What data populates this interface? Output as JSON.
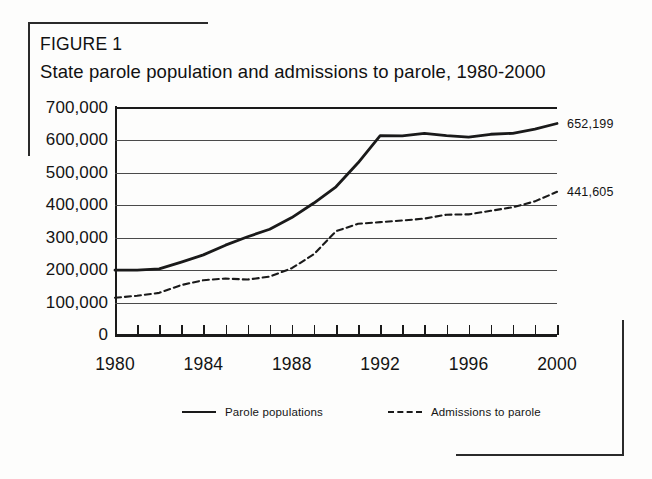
{
  "figure": {
    "label": "FIGURE 1",
    "title": "State parole population and admissions to parole, 1980-2000"
  },
  "legend": {
    "items": [
      {
        "label": "Parole populations",
        "style": "solid",
        "key_icon": "solid-line-icon"
      },
      {
        "label": "Admissions to parole",
        "style": "dashed",
        "key_icon": "dashed-line-icon"
      }
    ]
  },
  "axes": {
    "y_tick_labels": [
      "700,000",
      "600,000",
      "500,000",
      "400,000",
      "300,000",
      "200,000",
      "100,000",
      "0"
    ],
    "x_tick_labels": [
      "1980",
      "1984",
      "1988",
      "1992",
      "1996",
      "2000"
    ]
  },
  "end_labels": {
    "parole_populations": "652,199",
    "admissions_to_parole": "441,605"
  },
  "colors": {
    "ink": "#1a1a1a",
    "grid": "#4a4a4a",
    "paper": "#fdfdfc"
  },
  "chart_data": {
    "type": "line",
    "title": "State parole population and admissions to parole, 1980-2000",
    "xlabel": "",
    "ylabel": "",
    "xlim": [
      1980,
      2000
    ],
    "ylim": [
      0,
      700000
    ],
    "ytick_values": [
      0,
      100000,
      200000,
      300000,
      400000,
      500000,
      600000,
      700000
    ],
    "xtick_values": [
      1980,
      1984,
      1988,
      1992,
      1996,
      2000
    ],
    "xtick_labeled": [
      1980,
      1984,
      1988,
      1992,
      1996,
      2000
    ],
    "grid": true,
    "legend_position": "bottom",
    "x": [
      1980,
      1981,
      1982,
      1983,
      1984,
      1985,
      1986,
      1987,
      1988,
      1989,
      1990,
      1991,
      1992,
      1993,
      1994,
      1995,
      1996,
      1997,
      1998,
      1999,
      2000
    ],
    "series": [
      {
        "name": "Parole populations",
        "style": "solid",
        "end_label": "652,199",
        "values": [
          200000,
          200000,
          204000,
          225000,
          247000,
          277000,
          303000,
          326000,
          362000,
          407000,
          457000,
          531000,
          615000,
          614000,
          622000,
          615000,
          610000,
          619000,
          622000,
          635000,
          652199
        ]
      },
      {
        "name": "Admissions to parole",
        "style": "dashed",
        "end_label": "441,605",
        "values": [
          115000,
          121000,
          130000,
          154000,
          169000,
          174000,
          171000,
          180000,
          206000,
          249000,
          320000,
          343000,
          348000,
          353000,
          359000,
          371000,
          372000,
          383000,
          394000,
          412000,
          441605
        ]
      }
    ]
  }
}
